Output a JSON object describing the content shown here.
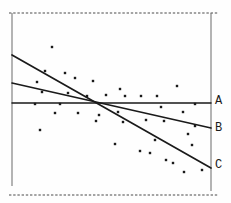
{
  "figure": {
    "title": "",
    "kind": "scatter plot with three candidate fitted lines"
  },
  "chart_data": {
    "type": "scatter",
    "title": "",
    "xlabel": "",
    "ylabel": "",
    "canvas_px": {
      "width": 231,
      "height": 203
    },
    "legend": "none",
    "grid": false,
    "colors": {
      "background": "#fefefe",
      "ink": "#1a1a1a",
      "frame_solid": "#6a6a6a",
      "frame_dashed": "#4a4a4a"
    },
    "frame_borders": [
      {
        "name": "frame-border-top",
        "x1": 9,
        "y1": 13,
        "x2": 218,
        "y2": 13,
        "style": "dashed"
      },
      {
        "name": "frame-border-bottom",
        "x1": 9,
        "y1": 195,
        "x2": 218,
        "y2": 195,
        "style": "dashed"
      },
      {
        "name": "frame-border-left",
        "x1": 12,
        "y1": 13,
        "x2": 12,
        "y2": 186,
        "style": "solid"
      },
      {
        "name": "frame-border-right",
        "x1": 211,
        "y1": 13,
        "x2": 211,
        "y2": 191,
        "style": "solid"
      }
    ],
    "lines": [
      {
        "label": "A",
        "slope": "zero (horizontal)",
        "x1": 12,
        "y1": 103,
        "x2": 211,
        "y2": 103,
        "width": 1.5,
        "label_x": 215,
        "label_y": 104
      },
      {
        "label": "B",
        "slope": "shallow negative",
        "x1": 12,
        "y1": 83,
        "x2": 211,
        "y2": 128,
        "width": 1.7,
        "label_x": 215,
        "label_y": 131
      },
      {
        "label": "C",
        "slope": "steep negative",
        "x1": 12,
        "y1": 55,
        "x2": 211,
        "y2": 168,
        "width": 1.7,
        "label_x": 215,
        "label_y": 168
      }
    ],
    "points_px": [
      [
        52,
        47
      ],
      [
        45,
        71
      ],
      [
        65,
        73
      ],
      [
        75,
        78
      ],
      [
        37,
        82
      ],
      [
        93,
        81
      ],
      [
        177,
        86
      ],
      [
        120,
        89
      ],
      [
        42,
        92
      ],
      [
        68,
        93
      ],
      [
        106,
        95
      ],
      [
        87,
        96
      ],
      [
        125,
        96
      ],
      [
        141,
        96
      ],
      [
        157,
        96
      ],
      [
        35,
        104
      ],
      [
        60,
        104
      ],
      [
        195,
        104
      ],
      [
        161,
        107
      ],
      [
        118,
        112
      ],
      [
        183,
        112
      ],
      [
        55,
        113
      ],
      [
        78,
        113
      ],
      [
        99,
        115
      ],
      [
        146,
        120
      ],
      [
        96,
        121
      ],
      [
        164,
        121
      ],
      [
        123,
        122
      ],
      [
        195,
        126
      ],
      [
        40,
        130
      ],
      [
        188,
        134
      ],
      [
        155,
        140
      ],
      [
        115,
        144
      ],
      [
        192,
        145
      ],
      [
        140,
        151
      ],
      [
        150,
        153
      ],
      [
        166,
        160
      ],
      [
        173,
        163
      ],
      [
        202,
        170
      ],
      [
        184,
        172
      ]
    ],
    "point_size_px": 2.4
  }
}
